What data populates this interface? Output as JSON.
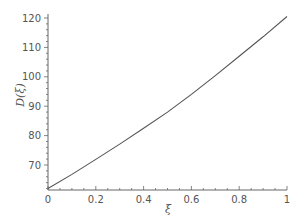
{
  "chart_data": {
    "type": "line",
    "title": "",
    "xlabel": "ξ",
    "ylabel": "D(ξ)",
    "xlim": [
      0,
      1
    ],
    "ylim": [
      61,
      122
    ],
    "grid": false,
    "legend": null,
    "x_ticks": [
      0,
      0.2,
      0.4,
      0.6,
      0.8,
      1
    ],
    "x_tick_labels": [
      "0",
      "0.2",
      "0.4",
      "0.6",
      "0.8",
      "1"
    ],
    "y_ticks": [
      70,
      80,
      90,
      100,
      110,
      120
    ],
    "y_tick_labels": [
      "70",
      "80",
      "90",
      "100",
      "110",
      "120"
    ],
    "series": [
      {
        "name": "D(ξ)",
        "color": "#555555",
        "x": [
          0,
          0.1,
          0.2,
          0.3,
          0.4,
          0.5,
          0.6,
          0.7,
          0.8,
          0.9,
          1.0
        ],
        "values": [
          62.0,
          66.8,
          71.9,
          77.1,
          82.5,
          88.0,
          94.0,
          100.4,
          107.0,
          113.6,
          120.5
        ]
      }
    ]
  }
}
